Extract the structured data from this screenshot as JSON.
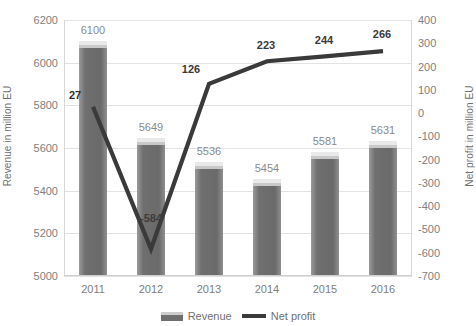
{
  "chart_data": {
    "type": "bar",
    "title": "",
    "subtitle": "",
    "categories": [
      "2011",
      "2012",
      "2013",
      "2014",
      "2015",
      "2016"
    ],
    "xlabel": "",
    "ylabel": "Revenue in million EU",
    "y2label": "Net profit in million EU",
    "ylim": [
      5000,
      6200
    ],
    "y2lim": [
      -700,
      400
    ],
    "yticks": [
      "6200",
      "6000",
      "5800",
      "5600",
      "5400",
      "5200",
      "5000"
    ],
    "y2ticks": [
      "400",
      "300",
      "200",
      "100",
      "0",
      "-100",
      "-200",
      "-300",
      "-400",
      "-500",
      "-600",
      "-700"
    ],
    "grid": true,
    "legend_position": "bottom",
    "series": [
      {
        "name": "Revenue",
        "type": "bar",
        "axis": "left",
        "values": [
          6100,
          5649,
          5536,
          5454,
          5581,
          5631
        ],
        "labels": [
          "6100",
          "5649",
          "5536",
          "5454",
          "5581",
          "5631"
        ],
        "color": "#6f6f6f"
      },
      {
        "name": "Net profit",
        "type": "line",
        "axis": "right",
        "values": [
          27,
          -584,
          126,
          223,
          244,
          266
        ],
        "labels": [
          "27",
          "-584",
          "126",
          "223",
          "244",
          "266"
        ],
        "color": "#3a3a3a"
      }
    ]
  },
  "legend": {
    "revenue_label": "Revenue",
    "net_profit_label": "Net profit"
  },
  "axes": {
    "left_title": "Revenue in million EU",
    "right_title": "Net profit in million EU"
  }
}
